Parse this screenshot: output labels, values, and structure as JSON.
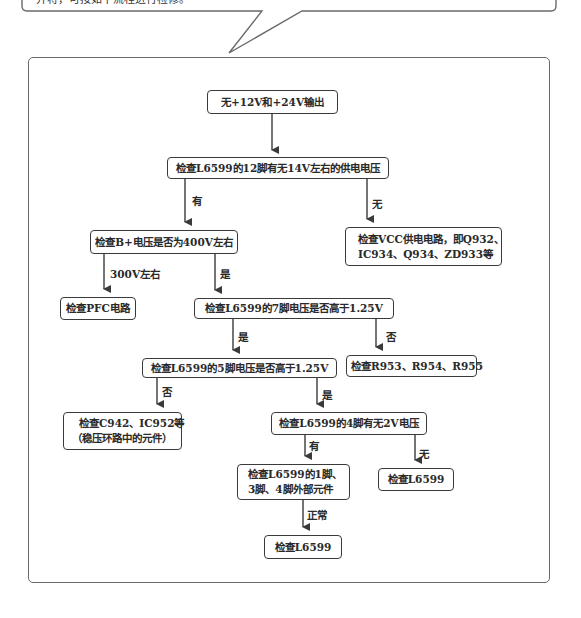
{
  "callout": {
    "partial_text": "并将，可按如下流程进行检修。",
    "note": "top line of text is cropped at image edge"
  },
  "flowchart": {
    "nodes": {
      "start": {
        "text": "无+12V和+24V输出"
      },
      "check_pin12": {
        "text": "检查L6599的12脚有无14V左右的供电电压"
      },
      "check_bplus": {
        "text": "检查B+电压是否为400V左右"
      },
      "check_vcc": {
        "line1": "检查VCC供电电路，即Q932、",
        "line2": "IC934、Q934、ZD933等"
      },
      "check_pfc": {
        "text": "检查PFC电路"
      },
      "check_pin7": {
        "text": "检查L6599的7脚电压是否高于1.25V"
      },
      "check_r953": {
        "text": "检查R953、R954、R955"
      },
      "check_pin5": {
        "text": "检查L6599的5脚电压是否高于1.25V"
      },
      "check_c942": {
        "line1": "检查C942、IC952等",
        "line2": "（稳压环路中的元件）"
      },
      "check_pin4": {
        "text": "检查L6599的4脚有无2V电压"
      },
      "check_pin134": {
        "line1": "检查L6599的1脚、",
        "line2": "3脚、4脚外部元件"
      },
      "check_l6599_right": {
        "text": "检查L6599"
      },
      "check_l6599_bottom": {
        "text": "检查L6599"
      }
    },
    "edge_labels": {
      "pin12_yes": "有",
      "pin12_no": "无",
      "bplus_300v": "300V左右",
      "bplus_yes": "是",
      "pin7_yes": "是",
      "pin7_no": "否",
      "pin5_no": "否",
      "pin5_yes": "是",
      "pin4_yes": "有",
      "pin4_no": "无",
      "pin134_normal": "正常"
    },
    "colors": {
      "box_border": "#3a3a3a",
      "arrow": "#3a3a3a",
      "frame_border": "#6a6a6a",
      "background": "#ffffff"
    }
  }
}
